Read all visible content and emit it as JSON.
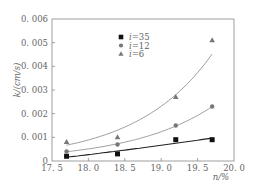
{
  "chart_data": {
    "type": "scatter",
    "title": "",
    "xlabel": "n/%",
    "ylabel": "k/(cm/s)",
    "xlim": [
      17.5,
      20.0
    ],
    "ylim": [
      0,
      0.006
    ],
    "xticks": [
      17.5,
      18.0,
      18.5,
      19.0,
      19.5,
      20.0
    ],
    "xtick_labels": [
      "17.5",
      "18.0",
      "18.5",
      "19.0",
      "19.5",
      "20.0"
    ],
    "yticks": [
      0,
      0.001,
      0.002,
      0.003,
      0.004,
      0.005,
      0.006
    ],
    "ytick_labels": [
      "0",
      "0.001",
      "0.002",
      "0.003",
      "0.004",
      "0.005",
      "0.006"
    ],
    "grid": false,
    "legend_position": "upper-center",
    "series": [
      {
        "name": "i=35",
        "marker": "square",
        "x": [
          17.7,
          18.4,
          19.2,
          19.7
        ],
        "values": [
          0.0002,
          0.0003,
          0.0009,
          0.0009
        ],
        "fit": "curve"
      },
      {
        "name": "i=12",
        "marker": "circle",
        "x": [
          17.7,
          18.4,
          19.2,
          19.7
        ],
        "values": [
          0.0004,
          0.0007,
          0.0015,
          0.0023
        ],
        "fit": "exponential"
      },
      {
        "name": "i=6",
        "marker": "triangle",
        "x": [
          17.7,
          18.4,
          19.2,
          19.7
        ],
        "values": [
          0.0008,
          0.001,
          0.0027,
          0.0051
        ],
        "fit": "exponential"
      }
    ]
  },
  "legend": {
    "items": [
      {
        "prefix": "i",
        "label": "=35"
      },
      {
        "prefix": "i",
        "label": "=12"
      },
      {
        "prefix": "i",
        "label": "=6"
      }
    ]
  },
  "axes": {
    "x_title": "n/%",
    "y_title": "k/(cm/s)"
  },
  "colors": {
    "axis": "#888888",
    "square": "#111111",
    "circle": "#777777",
    "triangle": "#777777",
    "curve_35": "#222222",
    "curve_12": "#888888",
    "curve_6": "#888888"
  }
}
